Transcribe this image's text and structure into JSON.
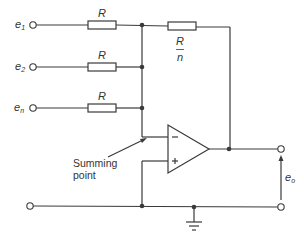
{
  "diagram": {
    "type": "circuit",
    "inputs": [
      {
        "name": "e",
        "sub": "1",
        "resistor": "R"
      },
      {
        "name": "e",
        "sub": "2",
        "resistor": "R"
      },
      {
        "name": "e",
        "sub": "n",
        "resistor": "R"
      }
    ],
    "feedback_resistor": {
      "num": "R",
      "den": "n"
    },
    "opamp": {
      "minus": "−",
      "plus": "+"
    },
    "annotation": {
      "line1": "Summing",
      "line2": "point"
    },
    "output": {
      "name": "e",
      "sub": "o"
    },
    "colors": {
      "line": "#3a3a3a",
      "text": "#333333"
    }
  }
}
